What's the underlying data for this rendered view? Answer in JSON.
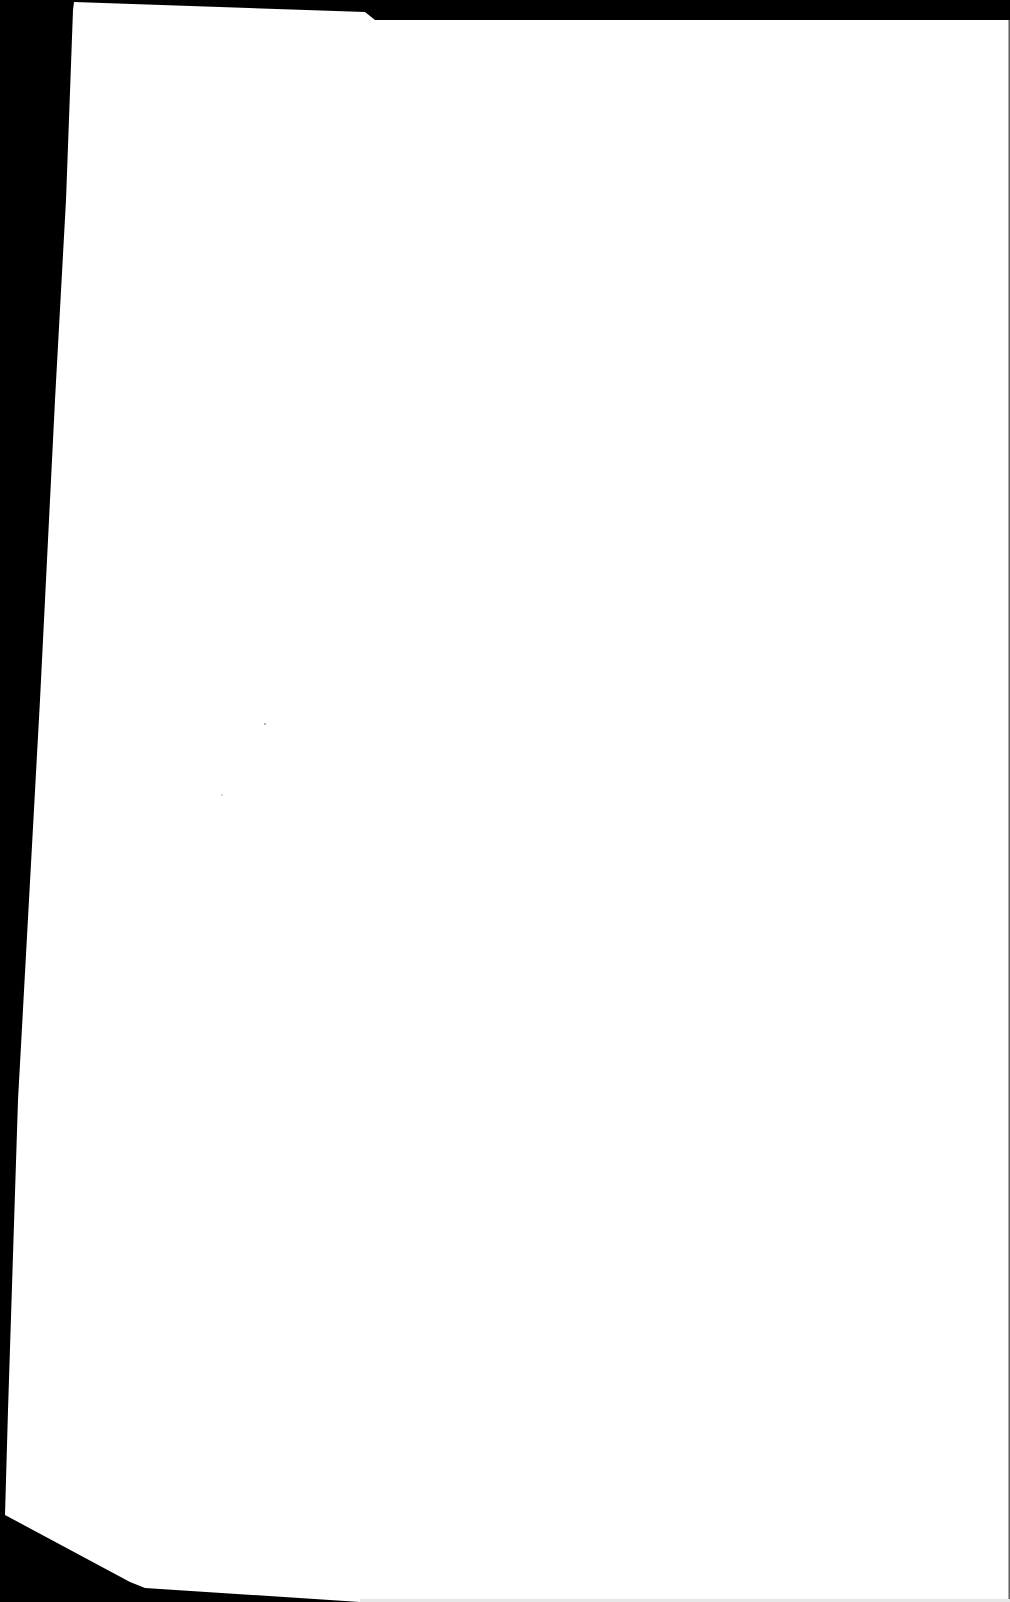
{
  "document": {
    "type": "scanned-page",
    "page_text": "",
    "colors": {
      "background": "#000000",
      "paper": "#ffffff"
    }
  }
}
